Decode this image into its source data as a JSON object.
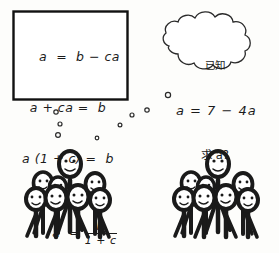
{
  "scene": {
    "title": "Algebra solution cartoon with cheering crowds",
    "background_color": "#fdfdfb",
    "ink_color": "#1a1a1a"
  },
  "equation_box": {
    "name": "solution-steps",
    "lines": [
      {
        "lhs": "a",
        "rel": "=",
        "rhs": "b − ca"
      },
      {
        "lhs": "a + ca",
        "rel": "=",
        "rhs": "b"
      },
      {
        "lhs": "a (1 + c)",
        "rel": "=",
        "rhs": "b"
      },
      {
        "lhs": "a",
        "rel": "=",
        "rhs": "fraction"
      }
    ],
    "line_1": "a  =  b − ca",
    "line_2": "a + ca =  b",
    "line_3": "a (1 + c) =  b",
    "line_4_lhs": "a  =",
    "fraction_numerator": "b",
    "fraction_denominator": "1 + c"
  },
  "thought_cloud": {
    "name": "student-thought-bubble",
    "line_1": "已知",
    "line_2": "a = 7 − 4a",
    "line_3": "求 a?"
  },
  "thought_trails": {
    "left_trail_label": "thought-dots-left",
    "right_trail_label": "thought-dots-right",
    "left_dots": [
      {
        "cx": 56,
        "cy": 112,
        "r": 2.2
      },
      {
        "cx": 60,
        "cy": 124,
        "r": 2.0
      },
      {
        "cx": 58,
        "cy": 135,
        "r": 2.4
      },
      {
        "cx": 97,
        "cy": 138,
        "r": 1.8
      }
    ],
    "right_dots": [
      {
        "cx": 168,
        "cy": 95,
        "r": 2.6
      },
      {
        "cx": 147,
        "cy": 110,
        "r": 2.2
      },
      {
        "cx": 132,
        "cy": 115,
        "r": 2.0
      },
      {
        "cx": 120,
        "cy": 125,
        "r": 1.9
      }
    ]
  },
  "crowds": [
    {
      "name": "crowd-left",
      "count": 7,
      "description": "smiling stick figures, tall one centered behind"
    },
    {
      "name": "crowd-right",
      "count": 7,
      "description": "smiling stick figures, tall one centered behind"
    }
  ]
}
